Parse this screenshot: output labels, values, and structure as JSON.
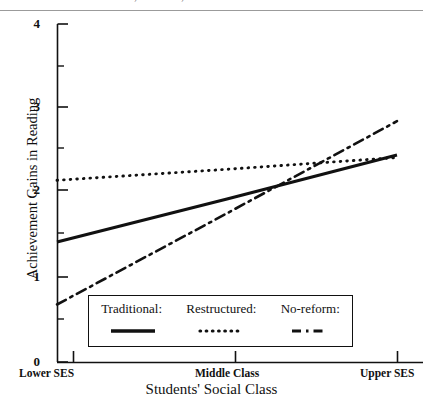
{
  "caption": {
    "text": "of different SES in no-reform, traditional, and restructured schools."
  },
  "chart_data": {
    "type": "line",
    "title": "",
    "xlabel": "Students' Social Class",
    "ylabel": "Achievement Gains in Reading",
    "x": [
      0,
      1,
      2
    ],
    "categories": [
      "Lower SES",
      "Middle Class",
      "Upper SES"
    ],
    "xtick_labels": [
      "Lower SES",
      "Middle Class",
      "Upper SES"
    ],
    "ytick_labels": [
      "0",
      "1",
      "2",
      "3",
      "4"
    ],
    "ylim": [
      0,
      4
    ],
    "yticks": [
      0,
      1,
      2,
      3,
      4
    ],
    "minor_yticks": [
      0.5,
      1.5,
      2.5,
      3.5
    ],
    "grid": false,
    "legend_position": "lower center",
    "series": [
      {
        "name": "Traditional:",
        "style": "solid",
        "values": [
          1.42,
          1.93,
          2.45
        ]
      },
      {
        "name": "Restructured:",
        "style": "dotted",
        "values": [
          2.15,
          2.28,
          2.42
        ]
      },
      {
        "name": "No-reform:",
        "style": "dashdot",
        "values": [
          0.68,
          1.76,
          2.85
        ]
      }
    ]
  },
  "axis": {
    "y_label": "Achievement Gains in Reading",
    "x_label": "Students' Social Class",
    "y_ticks": [
      {
        "label": "4",
        "value": 4
      },
      {
        "label": "3",
        "value": 3
      },
      {
        "label": "2",
        "value": 2
      },
      {
        "label": "1",
        "value": 1
      },
      {
        "label": "0",
        "value": 0
      }
    ],
    "x_ticks": [
      {
        "label": "Lower SES"
      },
      {
        "label": "Middle Class"
      },
      {
        "label": "Upper SES"
      }
    ]
  },
  "legend": {
    "entries": [
      {
        "label": "Traditional:",
        "style": "solid"
      },
      {
        "label": "Restructured:",
        "style": "dotted"
      },
      {
        "label": "No-reform:",
        "style": "dashdot"
      }
    ]
  }
}
